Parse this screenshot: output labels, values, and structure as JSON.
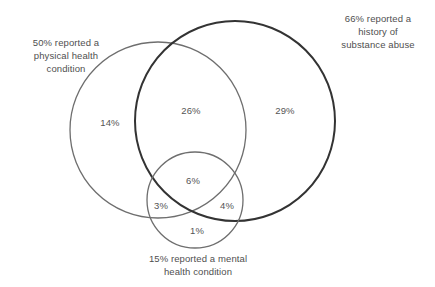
{
  "chart_data": {
    "type": "venn",
    "title": "",
    "sets": [
      {
        "id": "physical",
        "label": "50% reported a\nphysical health\ncondition",
        "total_percent": "50%",
        "stroke": "#6e6e6e",
        "stroke_width": 1.3,
        "cx": 158,
        "cy": 130,
        "r": 88
      },
      {
        "id": "substance",
        "label": "66% reported a\nhistory of\nsubstance abuse",
        "total_percent": "66%",
        "stroke": "#333333",
        "stroke_width": 2.0,
        "cx": 235,
        "cy": 121,
        "r": 100
      },
      {
        "id": "mental",
        "label": "15% reported a mental\nhealth condition",
        "total_percent": "15%",
        "stroke": "#6e6e6e",
        "stroke_width": 1.3,
        "cx": 195,
        "cy": 200,
        "r": 48
      }
    ],
    "regions": [
      {
        "id": "physical-only",
        "sets": [
          "physical"
        ],
        "value": "14%"
      },
      {
        "id": "physical-substance",
        "sets": [
          "physical",
          "substance"
        ],
        "value": "26%"
      },
      {
        "id": "substance-only",
        "sets": [
          "substance"
        ],
        "value": "29%"
      },
      {
        "id": "all-three",
        "sets": [
          "physical",
          "substance",
          "mental"
        ],
        "value": "6%"
      },
      {
        "id": "physical-mental",
        "sets": [
          "physical",
          "mental"
        ],
        "value": "3%"
      },
      {
        "id": "substance-mental",
        "sets": [
          "substance",
          "mental"
        ],
        "value": "4%"
      },
      {
        "id": "mental-only",
        "sets": [
          "mental"
        ],
        "value": "1%"
      }
    ],
    "background": "#ffffff",
    "text_color": "#4f4f4f",
    "legend": "none",
    "grid": false
  }
}
